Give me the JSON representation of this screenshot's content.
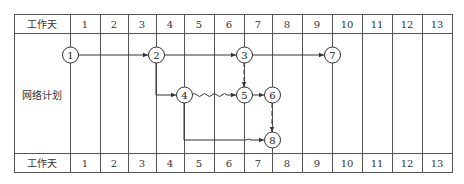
{
  "table": {
    "header_label": "工作天",
    "row_label": "网络计划",
    "footer_label": "工作天",
    "days": [
      "1",
      "2",
      "3",
      "4",
      "5",
      "6",
      "7",
      "8",
      "9",
      "10",
      "11",
      "12",
      "13"
    ]
  },
  "network": {
    "nodes": [
      {
        "id": "1",
        "label": "1",
        "day_line": 1,
        "row": "top"
      },
      {
        "id": "2",
        "label": "2",
        "day_line": 4,
        "row": "top"
      },
      {
        "id": "3",
        "label": "3",
        "day_line": 7,
        "row": "top"
      },
      {
        "id": "7",
        "label": "7",
        "day_line": 10,
        "row": "top"
      },
      {
        "id": "4",
        "label": "4",
        "day_line": 5,
        "row": "middle"
      },
      {
        "id": "5",
        "label": "5",
        "day_line": 7,
        "row": "middle"
      },
      {
        "id": "6",
        "label": "6",
        "day_line": 8,
        "row": "middle"
      },
      {
        "id": "8",
        "label": "8",
        "day_line": 8,
        "row": "bottom"
      }
    ],
    "edges": [
      {
        "from": "1",
        "to": "2",
        "style": "solid"
      },
      {
        "from": "2",
        "to": "3",
        "style": "solid"
      },
      {
        "from": "3",
        "to": "7",
        "style": "solid"
      },
      {
        "from": "2",
        "to": "4",
        "style": "solid"
      },
      {
        "from": "4",
        "to": "5",
        "style": "wavy"
      },
      {
        "from": "3",
        "to": "5",
        "style": "dashed"
      },
      {
        "from": "5",
        "to": "6",
        "style": "solid"
      },
      {
        "from": "6",
        "to": "8",
        "style": "dashed"
      },
      {
        "from": "4",
        "to": "8",
        "style": "solid-then-wavy"
      }
    ]
  }
}
